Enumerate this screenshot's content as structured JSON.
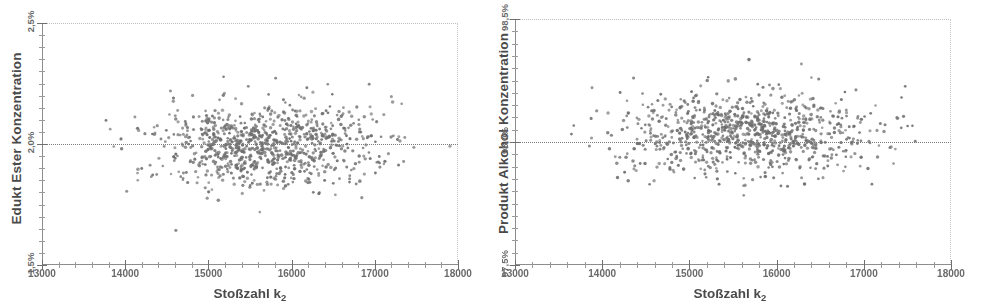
{
  "figure": {
    "type": "scatter-pair",
    "background": "#ffffff",
    "point_color": "#6e6e6e"
  },
  "charts": [
    {
      "id": "edukt-ester",
      "type": "scatter",
      "title": "",
      "xlabel": "Stoßzahl k",
      "xlabel_sub": "2",
      "ylabel": "Edukt Ester Konzentration",
      "xlim": [
        13000,
        18000
      ],
      "ylim": [
        1.5,
        2.5
      ],
      "xticks": [
        13000,
        14000,
        15000,
        16000,
        17000,
        18000
      ],
      "xticklabels": [
        "13000",
        "14000",
        "15000",
        "16000",
        "17000",
        "18000"
      ],
      "yticks": [
        1.5,
        2.0,
        2.5
      ],
      "yticklabels": [
        "1,5%",
        "2,0%",
        "2,5%"
      ],
      "y_minor_step": 0.05,
      "x_minor_step": 200,
      "grid": false,
      "reference_line": {
        "axis": "y",
        "value": 2.0,
        "label": "2,0%",
        "style": "dotted"
      },
      "n_points": 900,
      "x_mean": 15650,
      "x_sd": 700,
      "y_mean": 2.0,
      "y_sd": 0.085,
      "seed": 1337
    },
    {
      "id": "produkt-alkohol",
      "type": "scatter",
      "title": "",
      "xlabel": "Stoßzahl k",
      "xlabel_sub": "2",
      "ylabel": "Produkt Alkohol Konzentration",
      "xlim": [
        13000,
        18000
      ],
      "ylim": [
        97.5,
        98.5
      ],
      "xticks": [
        13000,
        14000,
        15000,
        16000,
        17000,
        18000
      ],
      "xticklabels": [
        "13000",
        "14000",
        "15000",
        "16000",
        "17000",
        "18000"
      ],
      "yticks": [
        97.5,
        98.0,
        98.5
      ],
      "yticklabels": [
        "97,5%",
        "98,0%",
        "98,5%"
      ],
      "y_minor_step": 0.05,
      "x_minor_step": 200,
      "grid": false,
      "reference_line": {
        "axis": "y",
        "value": 98.0,
        "label": "98,0%",
        "style": "dotted"
      },
      "n_points": 900,
      "x_mean": 15650,
      "x_sd": 700,
      "y_mean": 98.03,
      "y_sd": 0.085,
      "seed": 2024
    }
  ],
  "chart_data": [
    {
      "type": "scatter",
      "title": "",
      "xlabel": "Stoßzahl k2",
      "ylabel": "Edukt Ester Konzentration",
      "xlim": [
        13000,
        18000
      ],
      "ylim": [
        1.5,
        2.5
      ],
      "xticklabels": [
        "13000",
        "14000",
        "15000",
        "16000",
        "17000",
        "18000"
      ],
      "yticklabels": [
        "1,5%",
        "2,0%",
        "2,5%"
      ],
      "grid": false,
      "legend": null,
      "annotations": [
        "dotted reference line at 2,0%"
      ],
      "series": [
        {
          "name": "Edukt Ester Konzentration vs. Stoßzahl k2",
          "description": "Dense cloud of ~900 simulation points, no visible trend; x concentrated 14500–16800, y centred on 2,0% with spread roughly 1,75%–2,30%.",
          "x_range_observed": [
            13250,
            17900
          ],
          "y_range_observed": [
            1.62,
            2.45
          ],
          "x_mean": 15650,
          "y_mean": 2.0,
          "y_sd": 0.085,
          "correlation": 0.0
        }
      ]
    },
    {
      "type": "scatter",
      "title": "",
      "xlabel": "Stoßzahl k2",
      "ylabel": "Produkt Alkohol Konzentration",
      "xlim": [
        13000,
        18000
      ],
      "ylim": [
        97.5,
        98.5
      ],
      "xticklabels": [
        "13000",
        "14000",
        "15000",
        "16000",
        "17000",
        "18000"
      ],
      "yticklabels": [
        "97,5%",
        "98,0%",
        "98,5%"
      ],
      "grid": false,
      "legend": null,
      "annotations": [
        "dotted reference line at 98,0%"
      ],
      "series": [
        {
          "name": "Produkt Alkohol Konzentration vs. Stoßzahl k2",
          "description": "Dense cloud of ~900 simulation points, no visible trend; x concentrated 14500–16800, y centred just above 98,0% with spread roughly 97,72%–98,42%.",
          "x_range_observed": [
            13250,
            17850
          ],
          "y_range_observed": [
            97.62,
            98.45
          ],
          "x_mean": 15650,
          "y_mean": 98.03,
          "y_sd": 0.085,
          "correlation": 0.0
        }
      ]
    }
  ]
}
